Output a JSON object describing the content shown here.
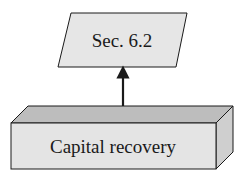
{
  "diagram": {
    "top_node": {
      "label": "Sec. 6.2",
      "shape": "parallelogram",
      "fill": "#e6e6e6"
    },
    "bottom_node": {
      "label": "Capital recovery",
      "shape": "3d-box",
      "front_fill": "#e4e4e4",
      "top_fill": "#bdbdbd",
      "side_fill": "#cfcfcf"
    },
    "edge": {
      "from": "bottom_node",
      "to": "top_node",
      "arrow": "up-arrow"
    },
    "colors": {
      "stroke": "#1a1a1a"
    }
  }
}
